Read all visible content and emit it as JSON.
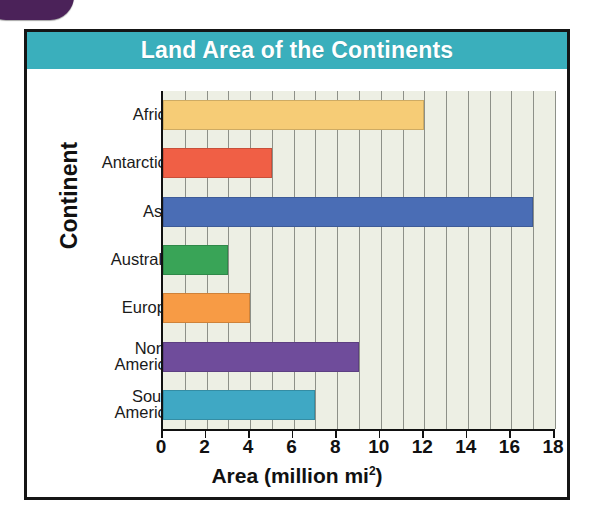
{
  "decor": {
    "corner_tab_color": "#4B2259"
  },
  "chart_data": {
    "type": "bar",
    "orientation": "horizontal",
    "title": "Land Area of the Continents",
    "xlabel": "Area (million mi",
    "xlabel_sup": "2",
    "xlabel_tail": ")",
    "ylabel": "Continent",
    "categories": [
      "Africa",
      "Antarctica",
      "Asia",
      "Australia",
      "Europe",
      "North America",
      "South America"
    ],
    "category_lines": [
      [
        "Africa",
        ""
      ],
      [
        "Antarctica",
        ""
      ],
      [
        "Asia",
        ""
      ],
      [
        "Australia",
        ""
      ],
      [
        "Europe",
        ""
      ],
      [
        "North",
        "America"
      ],
      [
        "South",
        "America"
      ]
    ],
    "values": [
      12,
      5,
      17,
      3,
      4,
      9,
      7
    ],
    "bar_colors": [
      "#F6CC76",
      "#F05F45",
      "#4A6DB5",
      "#39A457",
      "#F79B45",
      "#6F4C9B",
      "#3FA8C4"
    ],
    "xlim": [
      0,
      18
    ],
    "xticks": [
      0,
      2,
      4,
      6,
      8,
      10,
      12,
      14,
      16,
      18
    ],
    "xtick_labels": [
      "0",
      "2",
      "4",
      "6",
      "8",
      "10",
      "12",
      "14",
      "16",
      "18"
    ],
    "grid": true,
    "grid_step": 1,
    "grid_color": "#8d9088",
    "plot_background": "#EDEFE4",
    "title_bar_color": "#3AAFBC",
    "title_text_color": "#FFFFFF",
    "legend": null
  }
}
